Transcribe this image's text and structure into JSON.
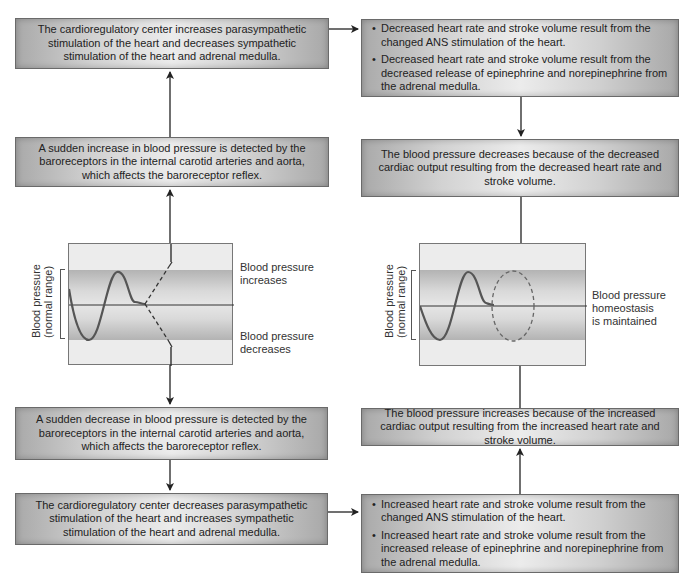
{
  "left_column": {
    "top_box": "The cardioregulatory center increases parasympathetic stimulation of the heart and decreases sympathetic stimulation of the heart  and adrenal medulla.",
    "increase_box": "A sudden increase in blood pressure is detected by the baroreceptors in the internal carotid arteries and aorta, which affects the baroreceptor reflex.",
    "graph": {
      "y_axis_label_line1": "Blood pressure",
      "y_axis_label_line2": "(normal range)",
      "label_increase_line1": "Blood pressure",
      "label_increase_line2": "increases",
      "label_decrease_line1": "Blood pressure",
      "label_decrease_line2": "decreases"
    },
    "decrease_box": "A sudden decrease in blood pressure is detected by the baroreceptors in the internal carotid arteries and aorta, which affects the baroreceptor reflex.",
    "bottom_box": "The cardioregulatory center decreases parasympathetic stimulation of the heart and increases sympathetic stimulation of the heart and adrenal medulla."
  },
  "right_column": {
    "top_box": {
      "bullets": [
        "Decreased heart rate and stroke volume result from the changed ANS stimulation of the heart.",
        "Decreased heart rate and stroke volume result from the decreased release of epinephrine and norepinephrine from the adrenal medulla."
      ]
    },
    "decrease_result_box": "The blood pressure decreases because of the decreased cardiac output resulting from the decreased heart rate and stroke volume.",
    "graph": {
      "y_axis_label_line1": "Blood pressure",
      "y_axis_label_line2": "(normal range)",
      "label_line1": "Blood pressure",
      "label_line2": "homeostasis",
      "label_line3": "is maintained"
    },
    "increase_result_box": "The blood pressure increases because of the increased cardiac output resulting from the increased heart rate and stroke volume.",
    "bottom_box": {
      "bullets": [
        "Increased heart rate and stroke volume result from the changed ANS stimulation of the heart.",
        "Increased heart rate and stroke volume result from the increased release of epinephrine and norepinephrine from the adrenal medulla."
      ]
    }
  },
  "colors": {
    "box_border": "#6a6a6a",
    "arrow": "#222222",
    "curve": "#555555",
    "band": "#c4c4c4",
    "graph_bg": "#ececec"
  }
}
